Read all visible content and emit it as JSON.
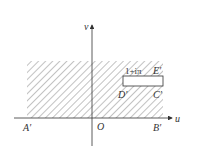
{
  "diagram": {
    "type": "complex-plane-region",
    "axes": {
      "horizontal_label": "u",
      "vertical_label": "v",
      "origin_label": "O"
    },
    "points": {
      "A": "A′",
      "B": "B′",
      "C": "C′",
      "D": "D′",
      "E": "E′"
    },
    "slit_label": "1+iπ",
    "colors": {
      "stroke": "#333333",
      "hatch": "#555555",
      "background": "#ffffff"
    }
  }
}
